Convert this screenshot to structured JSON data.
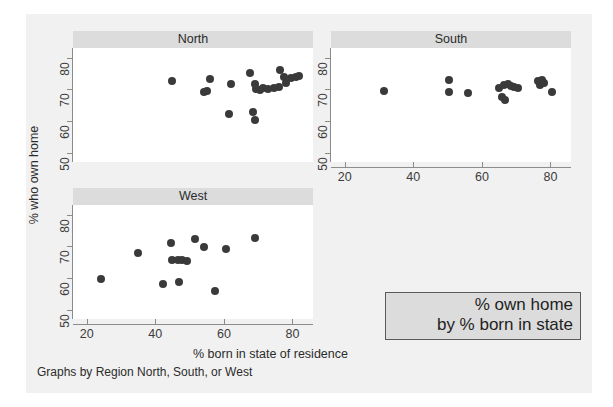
{
  "figure": {
    "title": "",
    "ytitle": "% who own home",
    "xtitle": "% born in state of residence",
    "note": "Graphs by Region North, South, or West",
    "legend_line1": "% own home",
    "legend_line2": "by % born in state",
    "marker_color": "#3a3a3a",
    "header_color": "#dcdcdc",
    "background_color": "#f1f1f1",
    "plot_background_color": "#ffffff",
    "axis_color": "#8c8c8c"
  },
  "chart_data": {
    "type": "scatter",
    "title": "% own home by % born in state",
    "xlabel": "% born in state of residence",
    "ylabel": "% who own home",
    "note": "Graphs by Region North, South, or West",
    "xlim": [
      16,
      86
    ],
    "ylim": [
      47,
      83
    ],
    "xticks": [
      20,
      40,
      60,
      80
    ],
    "yticks": [
      50,
      60,
      70,
      80
    ],
    "grid": false,
    "legend": {
      "position": "bottom-right",
      "lines": [
        "% own home",
        "by % born in state"
      ]
    },
    "facet_by": "Region",
    "panels": [
      {
        "label": "North",
        "points": [
          {
            "x": 45.0,
            "y": 72.5
          },
          {
            "x": 56.0,
            "y": 73.2
          },
          {
            "x": 55.0,
            "y": 69.3
          },
          {
            "x": 54.3,
            "y": 69.0
          },
          {
            "x": 62.0,
            "y": 71.5
          },
          {
            "x": 61.5,
            "y": 62.3
          },
          {
            "x": 68.5,
            "y": 62.8
          },
          {
            "x": 69.0,
            "y": 60.2
          },
          {
            "x": 67.5,
            "y": 75.0
          },
          {
            "x": 69.0,
            "y": 71.6
          },
          {
            "x": 69.5,
            "y": 70.0
          },
          {
            "x": 70.5,
            "y": 69.8
          },
          {
            "x": 71.5,
            "y": 70.3
          },
          {
            "x": 73.0,
            "y": 70.2
          },
          {
            "x": 74.5,
            "y": 70.4
          },
          {
            "x": 76.0,
            "y": 70.6
          },
          {
            "x": 76.5,
            "y": 76.0
          },
          {
            "x": 77.5,
            "y": 73.8
          },
          {
            "x": 78.0,
            "y": 72.0
          },
          {
            "x": 79.5,
            "y": 73.5
          },
          {
            "x": 81.0,
            "y": 74.0
          },
          {
            "x": 82.0,
            "y": 74.2
          }
        ]
      },
      {
        "label": "South",
        "points": [
          {
            "x": 31.5,
            "y": 69.5
          },
          {
            "x": 50.5,
            "y": 73.0
          },
          {
            "x": 50.5,
            "y": 69.0
          },
          {
            "x": 56.0,
            "y": 68.8
          },
          {
            "x": 65.0,
            "y": 70.5
          },
          {
            "x": 66.5,
            "y": 71.2
          },
          {
            "x": 67.5,
            "y": 71.5
          },
          {
            "x": 68.5,
            "y": 71.0
          },
          {
            "x": 69.5,
            "y": 70.6
          },
          {
            "x": 70.5,
            "y": 70.4
          },
          {
            "x": 66.0,
            "y": 67.5
          },
          {
            "x": 66.8,
            "y": 66.5
          },
          {
            "x": 76.5,
            "y": 72.5
          },
          {
            "x": 77.5,
            "y": 73.0
          },
          {
            "x": 77.0,
            "y": 71.3
          },
          {
            "x": 78.0,
            "y": 71.8
          },
          {
            "x": 80.5,
            "y": 69.0
          }
        ]
      },
      {
        "label": "West",
        "points": [
          {
            "x": 24.3,
            "y": 59.5
          },
          {
            "x": 35.0,
            "y": 67.8
          },
          {
            "x": 42.3,
            "y": 58.2
          },
          {
            "x": 44.5,
            "y": 71.0
          },
          {
            "x": 45.0,
            "y": 65.7
          },
          {
            "x": 46.5,
            "y": 65.6
          },
          {
            "x": 47.8,
            "y": 65.6
          },
          {
            "x": 49.2,
            "y": 65.4
          },
          {
            "x": 46.8,
            "y": 58.8
          },
          {
            "x": 51.5,
            "y": 72.3
          },
          {
            "x": 54.3,
            "y": 69.8
          },
          {
            "x": 57.5,
            "y": 56.0
          },
          {
            "x": 60.5,
            "y": 69.0
          },
          {
            "x": 69.0,
            "y": 72.5
          }
        ]
      }
    ]
  }
}
